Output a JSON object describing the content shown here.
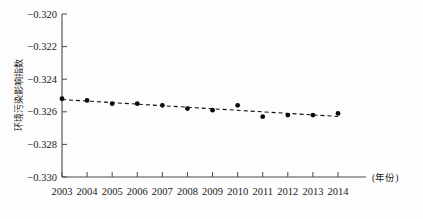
{
  "chart_data": {
    "type": "line",
    "title": "",
    "subtitle": "",
    "xlabel": "(年份)",
    "ylabel": "环境污染影响指数",
    "x": [
      2003,
      2004,
      2005,
      2006,
      2007,
      2008,
      2009,
      2010,
      2011,
      2012,
      2013,
      2014
    ],
    "categories": [
      "2003",
      "2004",
      "2005",
      "2006",
      "2007",
      "2008",
      "2009",
      "2010",
      "2011",
      "2012",
      "2013",
      "2014"
    ],
    "values": [
      -0.3252,
      -0.3253,
      -0.3255,
      -0.3255,
      -0.3256,
      -0.3258,
      -0.3259,
      -0.3256,
      -0.3263,
      -0.3262,
      -0.3262,
      -0.3261
    ],
    "series": [
      {
        "name": "环境污染影响指数",
        "values": [
          -0.3252,
          -0.3253,
          -0.3255,
          -0.3255,
          -0.3256,
          -0.3258,
          -0.3259,
          -0.3256,
          -0.3263,
          -0.3262,
          -0.3262,
          -0.3261
        ]
      }
    ],
    "ylim": [
      -0.33,
      -0.32
    ],
    "xlim": [
      2003,
      2014
    ],
    "ytick_labels": [
      "-0.320",
      "-0.322",
      "-0.324",
      "-0.326",
      "-0.328",
      "-0.330"
    ],
    "ytick_values": [
      -0.32,
      -0.322,
      -0.324,
      -0.326,
      -0.328,
      -0.33
    ],
    "xtick_labels": [
      "2003",
      "2004",
      "2005",
      "2006",
      "2007",
      "2008",
      "2009",
      "2010",
      "2011",
      "2012",
      "2013",
      "2014"
    ],
    "grid": false,
    "legend": "none",
    "line_style": "dashed",
    "marker": "filled-circle",
    "colors": {
      "line": "#111111",
      "marker": "#0a0a0a",
      "axis": "#4a4a4a",
      "background": "#fdfdfd",
      "text": "#1a1a1a"
    }
  },
  "axes": {
    "y_axis_title": "环境污染影响指数",
    "x_axis_title": "(年份)"
  }
}
